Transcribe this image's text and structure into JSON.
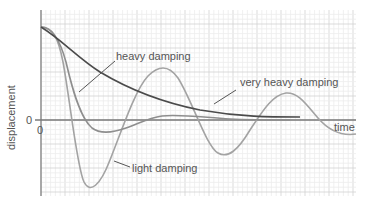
{
  "chart_data": {
    "type": "line",
    "title": "",
    "xlabel": "time",
    "ylabel": "displacement",
    "x_tick_labels": [
      "0"
    ],
    "y_tick_labels": [
      "0"
    ],
    "grid": true,
    "legend": "inline annotations",
    "x_range": [
      0,
      13
    ],
    "y_range": [
      -3.2,
      4.5
    ],
    "series": [
      {
        "name": "light damping",
        "color": "#a0a0a0",
        "points": [
          [
            0,
            4.0
          ],
          [
            0.5,
            3.0
          ],
          [
            1.2,
            0.0
          ],
          [
            2.2,
            -2.8
          ],
          [
            3.9,
            0.0
          ],
          [
            5.3,
            2.1
          ],
          [
            6.5,
            0.0
          ],
          [
            7.5,
            -1.5
          ],
          [
            9.0,
            0.0
          ],
          [
            10.2,
            1.1
          ],
          [
            11.6,
            0.0
          ],
          [
            12.9,
            -0.7
          ]
        ]
      },
      {
        "name": "heavy damping",
        "color": "#8f8f8f",
        "points": [
          [
            0,
            4.0
          ],
          [
            0.5,
            3.2
          ],
          [
            1.4,
            0.0
          ],
          [
            2.6,
            -0.45
          ],
          [
            4.4,
            0.0
          ],
          [
            5.4,
            0.2
          ],
          [
            7.0,
            0.05
          ],
          [
            9.5,
            0.0
          ]
        ]
      },
      {
        "name": "very heavy damping",
        "color": "#4a4a4a",
        "points": [
          [
            0,
            4.0
          ],
          [
            1.0,
            3.2
          ],
          [
            2.4,
            2.0
          ],
          [
            4.0,
            1.2
          ],
          [
            6.0,
            0.55
          ],
          [
            8.0,
            0.25
          ],
          [
            10.6,
            0.12
          ]
        ]
      }
    ],
    "annotations": [
      {
        "text": "heavy damping",
        "points_to": "heavy damping"
      },
      {
        "text": "very heavy damping",
        "points_to": "very heavy damping"
      },
      {
        "text": "light damping",
        "points_to": "light damping"
      }
    ]
  },
  "labels": {
    "ylabel": "displacement",
    "xlabel": "time",
    "y_zero": "0",
    "x_zero": "0",
    "heavy": "heavy damping",
    "very_heavy": "very heavy damping",
    "light": "light damping"
  },
  "colors": {
    "grid_minor": "#ececec",
    "grid_major": "#d2d2d2",
    "axis": "#7a7a7a",
    "light_curve": "#a3a3a3",
    "heavy_curve": "#8e8e8e",
    "very_heavy_curve": "#4b4b4b",
    "leader": "#555555"
  }
}
